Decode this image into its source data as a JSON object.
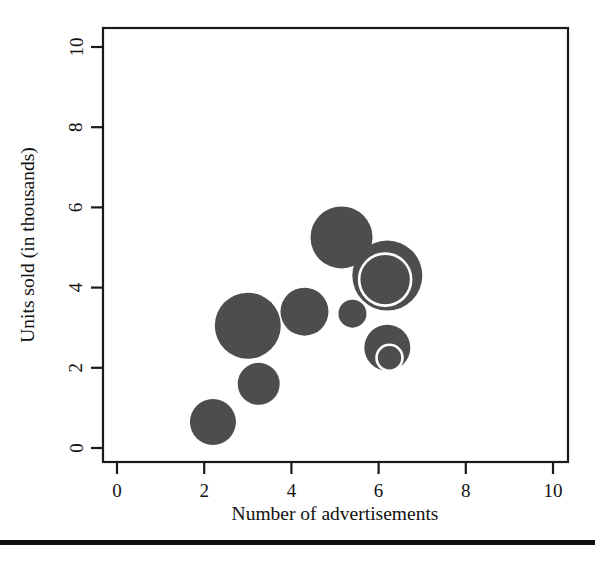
{
  "chart_data": {
    "type": "scatter",
    "variant": "bubble",
    "title": "",
    "xlabel": "Number of advertisements",
    "ylabel": "Units sold (in thousands)",
    "xlim": [
      0,
      10
    ],
    "ylim": [
      0,
      10
    ],
    "xticks": [
      "0",
      "2",
      "4",
      "6",
      "8",
      "10"
    ],
    "yticks": [
      "0",
      "2",
      "4",
      "6",
      "8",
      "10"
    ],
    "xtick_values": [
      0,
      2,
      4,
      6,
      8,
      10
    ],
    "ytick_values": [
      0,
      2,
      4,
      6,
      8,
      10
    ],
    "grid": false,
    "legend": false,
    "bubble_color": "#4d4d4d",
    "ring_color": "#ffffff",
    "points": [
      {
        "label": "point-1",
        "x": 2.2,
        "y": 0.65,
        "r": 23,
        "ring": null
      },
      {
        "label": "point-2",
        "x": 3.25,
        "y": 1.6,
        "r": 21,
        "ring": null
      },
      {
        "label": "point-3",
        "x": 3.0,
        "y": 3.05,
        "r": 33,
        "ring": null
      },
      {
        "label": "point-4",
        "x": 4.3,
        "y": 3.4,
        "r": 24,
        "ring": null
      },
      {
        "label": "point-5",
        "x": 5.4,
        "y": 3.35,
        "r": 14,
        "ring": null
      },
      {
        "label": "point-6",
        "x": 5.15,
        "y": 5.25,
        "r": 31,
        "ring": null
      },
      {
        "label": "point-7",
        "x": 6.2,
        "y": 4.3,
        "r": 35,
        "ring": {
          "cx": 6.15,
          "cy": 4.2,
          "r": 26
        }
      },
      {
        "label": "point-8",
        "x": 6.2,
        "y": 2.5,
        "r": 23,
        "ring": {
          "cx": 6.25,
          "cy": 2.25,
          "r": 13
        }
      }
    ]
  },
  "axes": {
    "x_title": "Number of advertisements",
    "y_title": "Units sold (in thousands)"
  }
}
